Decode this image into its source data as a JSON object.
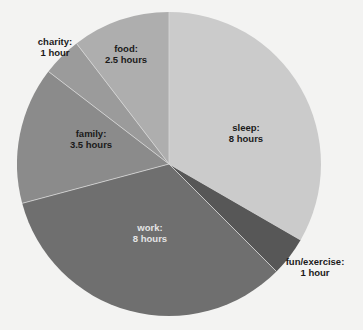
{
  "chart_data": {
    "type": "pie",
    "title": "",
    "unit": "hours",
    "total": 24,
    "start_angle_deg": 0,
    "direction": "clockwise",
    "background": "#f3f3f2",
    "center": [
      169,
      164
    ],
    "radius": 152,
    "slices": [
      {
        "name": "sleep",
        "value": 8,
        "label": "sleep:",
        "value_label": "8 hours",
        "color": "#cbcbcb",
        "label_color": "#1a1a1a",
        "label_pos": [
          246,
          133
        ]
      },
      {
        "name": "fun/exercise",
        "value": 1,
        "label": "fun/exercise:",
        "value_label": "1 hour",
        "color": "#575757",
        "label_color": "#1a1a1a",
        "label_pos": [
          315,
          267
        ]
      },
      {
        "name": "work",
        "value": 8,
        "label": "work:",
        "value_label": "8 hours",
        "color": "#6f6f6f",
        "label_color": "#e4e4e4",
        "label_pos": [
          150,
          233
        ]
      },
      {
        "name": "family",
        "value": 3.5,
        "label": "family:",
        "value_label": "3.5 hours",
        "color": "#8b8b8b",
        "label_color": "#1a1a1a",
        "label_pos": [
          91,
          139
        ]
      },
      {
        "name": "charity",
        "value": 1,
        "label": "charity:",
        "value_label": "1 hour",
        "color": "#9b9b9b",
        "label_color": "#1a1a1a",
        "label_pos": [
          55,
          47
        ]
      },
      {
        "name": "food",
        "value": 2.5,
        "label": "food:",
        "value_label": "2.5 hours",
        "color": "#aeaeae",
        "label_color": "#1a1a1a",
        "label_pos": [
          126,
          54
        ]
      }
    ]
  },
  "labels": {
    "sleep": {
      "name": "sleep:",
      "value": "8 hours"
    },
    "fun": {
      "name": "fun/exercise:",
      "value": "1 hour"
    },
    "work": {
      "name": "work:",
      "value": "8 hours"
    },
    "family": {
      "name": "family:",
      "value": "3.5 hours"
    },
    "charity": {
      "name": "charity:",
      "value": "1 hour"
    },
    "food": {
      "name": "food:",
      "value": "2.5 hours"
    }
  }
}
